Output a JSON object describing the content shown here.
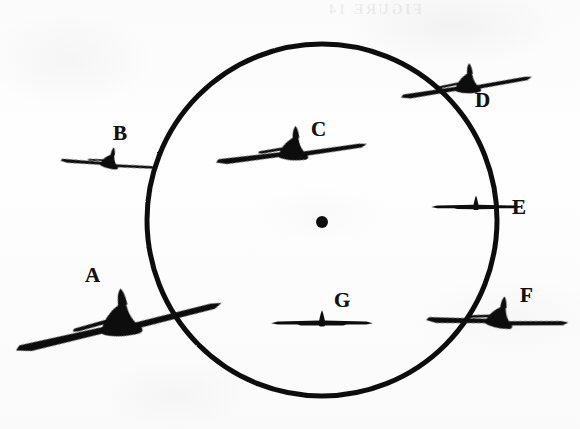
{
  "figure": {
    "background_color": "#fdfdfd",
    "ink_color": "#101010",
    "bleed_through_text": "FIGURE 14",
    "circle": {
      "name": "reference-circle",
      "center_x": 322,
      "center_y": 220,
      "radius_x": 175,
      "radius_y": 176,
      "stroke_width": 5,
      "stroke_color": "#101010"
    },
    "center_dot": {
      "name": "circle-center-dot",
      "x": 322,
      "y": 222,
      "radius": 6,
      "fill": "#0d0d0d"
    }
  },
  "aircraft": [
    {
      "id": "A",
      "label": "A",
      "label_x": 85,
      "label_y": 265,
      "x": 118,
      "y": 325,
      "scale": 1.72,
      "rotation_deg": -25,
      "view": "three-quarter",
      "position": "outside-lower-left",
      "size": "large"
    },
    {
      "id": "B",
      "label": "B",
      "label_x": 113,
      "label_y": 123,
      "x": 108,
      "y": 163,
      "scale": 0.78,
      "rotation_deg": -8,
      "view": "three-quarter",
      "position": "outside-upper-left",
      "size": "small"
    },
    {
      "id": "C",
      "label": "C",
      "label_x": 311,
      "label_y": 119,
      "x": 291,
      "y": 152,
      "scale": 1.24,
      "rotation_deg": -19,
      "view": "three-quarter",
      "position": "inside-upper",
      "size": "medium"
    },
    {
      "id": "D",
      "label": "D",
      "label_x": 475,
      "label_y": 90,
      "x": 466,
      "y": 86,
      "scale": 1.08,
      "rotation_deg": -21,
      "view": "three-quarter",
      "position": "on-circle-upper-right",
      "size": "medium"
    },
    {
      "id": "E",
      "label": "E",
      "label_x": 512,
      "label_y": 197,
      "x": 476,
      "y": 206,
      "scale": 0.72,
      "rotation_deg": 0,
      "view": "head-on",
      "position": "on-circle-right",
      "size": "small"
    },
    {
      "id": "F",
      "label": "F",
      "label_x": 520,
      "label_y": 285,
      "x": 497,
      "y": 320,
      "scale": 1.16,
      "rotation_deg": -11,
      "view": "three-quarter",
      "position": "on-circle-lower-right",
      "size": "medium"
    },
    {
      "id": "G",
      "label": "G",
      "label_x": 334,
      "label_y": 290,
      "x": 322,
      "y": 322,
      "scale": 0.82,
      "rotation_deg": 0,
      "view": "head-on",
      "position": "inside-lower",
      "size": "small"
    }
  ]
}
